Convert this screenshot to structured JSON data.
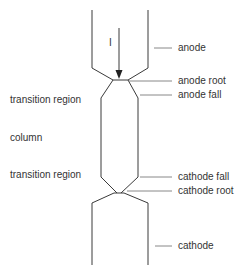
{
  "diagram": {
    "type": "arc-structure-schematic",
    "current_label": "I",
    "labels_right": {
      "anode": "anode",
      "anode_root": "anode root",
      "anode_fall": "anode fall",
      "cathode_fall": "cathode fall",
      "cathode_root": "cathode root",
      "cathode": "cathode"
    },
    "labels_left": {
      "transition_top": "transition region",
      "column": "column",
      "transition_bottom": "transition region"
    },
    "colors": {
      "line": "#3a3a3a",
      "leader": "#7a7a7a",
      "text": "#333333",
      "background": "#ffffff"
    }
  }
}
